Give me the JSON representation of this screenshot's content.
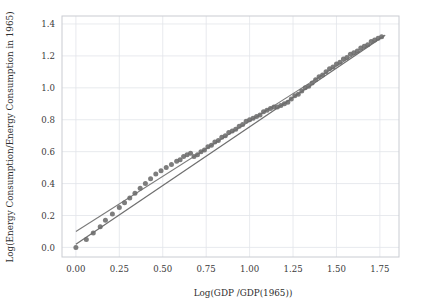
{
  "chart_data": {
    "type": "scatter",
    "title": "",
    "xlabel": "Log(GDP /GDP(1965))",
    "ylabel": "Log(Energy Consumption/Energy Consumption in 1965)",
    "xlim": [
      -0.08,
      1.86
    ],
    "ylim": [
      -0.06,
      1.45
    ],
    "xticks": [
      0.0,
      0.25,
      0.5,
      0.75,
      1.0,
      1.25,
      1.5,
      1.75
    ],
    "xticklabels": [
      "0.00",
      "0.25",
      "0.50",
      "0.75",
      "1.00",
      "1.25",
      "1.50",
      "1.75"
    ],
    "yticks": [
      0.0,
      0.2,
      0.4,
      0.6,
      0.8,
      1.0,
      1.2,
      1.4
    ],
    "yticklabels": [
      "0.0",
      "0.2",
      "0.4",
      "0.6",
      "0.8",
      "1.0",
      "1.2",
      "1.4"
    ],
    "grid": true,
    "legend": null,
    "marker_color": "#6b6b6b",
    "line_color": "#6f6f6f",
    "grid_color": "#e2e5ea",
    "series": [
      {
        "name": "observations",
        "type": "scatter",
        "x": [
          0.0,
          0.06,
          0.1,
          0.14,
          0.17,
          0.21,
          0.25,
          0.28,
          0.31,
          0.34,
          0.37,
          0.4,
          0.43,
          0.46,
          0.49,
          0.52,
          0.55,
          0.58,
          0.6,
          0.62,
          0.64,
          0.66,
          0.68,
          0.7,
          0.72,
          0.74,
          0.76,
          0.78,
          0.8,
          0.82,
          0.84,
          0.86,
          0.88,
          0.9,
          0.92,
          0.94,
          0.96,
          0.98,
          1.0,
          1.02,
          1.04,
          1.06,
          1.08,
          1.1,
          1.12,
          1.14,
          1.16,
          1.18,
          1.2,
          1.22,
          1.24,
          1.26,
          1.28,
          1.3,
          1.32,
          1.34,
          1.36,
          1.38,
          1.4,
          1.42,
          1.44,
          1.46,
          1.48,
          1.5,
          1.52,
          1.54,
          1.56,
          1.58,
          1.6,
          1.62,
          1.64,
          1.66,
          1.68,
          1.7,
          1.72,
          1.74,
          1.76
        ],
        "y": [
          0.0,
          0.05,
          0.09,
          0.13,
          0.17,
          0.21,
          0.25,
          0.28,
          0.31,
          0.34,
          0.37,
          0.4,
          0.43,
          0.46,
          0.48,
          0.5,
          0.52,
          0.54,
          0.55,
          0.57,
          0.58,
          0.59,
          0.57,
          0.58,
          0.6,
          0.61,
          0.63,
          0.64,
          0.66,
          0.67,
          0.69,
          0.7,
          0.72,
          0.73,
          0.74,
          0.76,
          0.77,
          0.79,
          0.8,
          0.81,
          0.82,
          0.83,
          0.85,
          0.86,
          0.87,
          0.88,
          0.88,
          0.89,
          0.9,
          0.91,
          0.93,
          0.95,
          0.96,
          0.98,
          1.0,
          1.01,
          1.03,
          1.05,
          1.07,
          1.08,
          1.1,
          1.12,
          1.13,
          1.15,
          1.16,
          1.18,
          1.19,
          1.21,
          1.22,
          1.23,
          1.25,
          1.26,
          1.27,
          1.29,
          1.3,
          1.31,
          1.32
        ]
      },
      {
        "name": "fit-line-primary",
        "type": "line",
        "x": [
          0.0,
          1.78
        ],
        "y": [
          0.02,
          1.33
        ]
      },
      {
        "name": "fit-line-secondary",
        "type": "line",
        "x": [
          0.0,
          1.78
        ],
        "y": [
          0.1,
          1.33
        ]
      }
    ]
  },
  "axes": {
    "x_title": "Log(GDP /GDP(1965))",
    "y_title": "Log(Energy Consumption/Energy Consumption in 1965)"
  }
}
